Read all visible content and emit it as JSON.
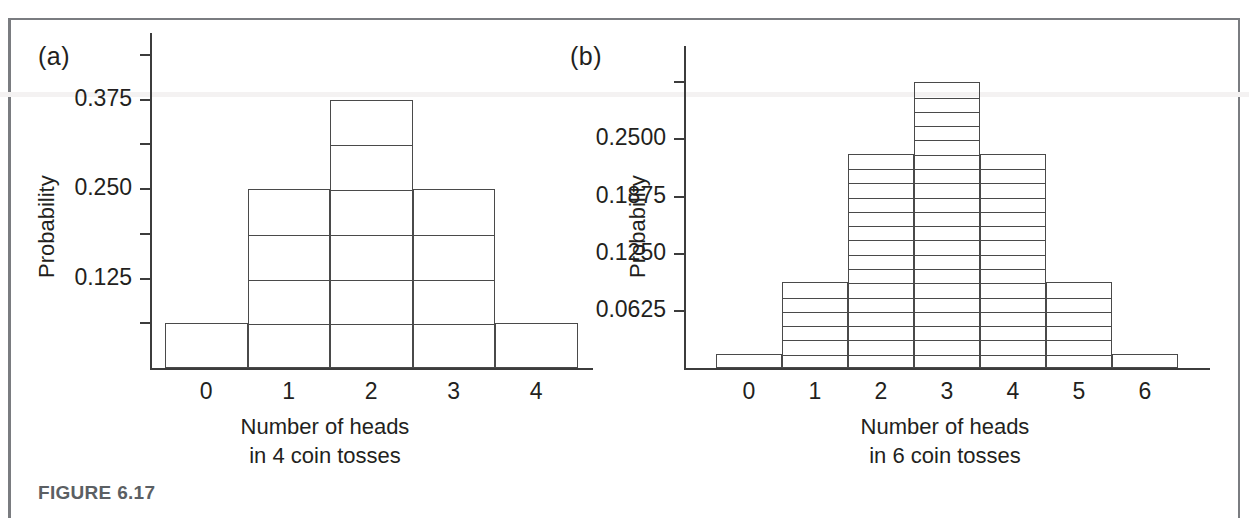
{
  "figure": {
    "caption": "FIGURE 6.17"
  },
  "panels": [
    {
      "key": "a",
      "label": "(a)",
      "ylabel": "Probability",
      "xlabel_line1": "Number of heads",
      "xlabel_line2": "in 4 coin tosses"
    },
    {
      "key": "b",
      "label": "(b)",
      "ylabel": "Probability",
      "xlabel_line1": "Number of heads",
      "xlabel_line2": "in 6 coin tosses"
    }
  ],
  "chart_data": [
    {
      "type": "bar",
      "panel": "a",
      "title": "",
      "xlabel": "Number of heads in 4 coin tosses",
      "ylabel": "Probability",
      "categories": [
        "0",
        "1",
        "2",
        "3",
        "4"
      ],
      "values": [
        0.0625,
        0.25,
        0.375,
        0.25,
        0.0625
      ],
      "counts_out_of_16": [
        1,
        4,
        6,
        4,
        1
      ],
      "ytick_labels": [
        "0.125",
        "0.250",
        "0.375"
      ],
      "ytick_values": [
        0.125,
        0.25,
        0.375
      ],
      "minor_tick_step": 0.0625,
      "ylim": [
        0,
        0.4375
      ],
      "xlim": [
        -0.5,
        4.5
      ],
      "grid": false,
      "legend": "none",
      "bar_fill": "none",
      "bar_subdivision": "0.0625"
    },
    {
      "type": "bar",
      "panel": "b",
      "title": "",
      "xlabel": "Number of heads in 6 coin tosses",
      "ylabel": "Probability",
      "categories": [
        "0",
        "1",
        "2",
        "3",
        "4",
        "5",
        "6"
      ],
      "values": [
        0.015625,
        0.09375,
        0.234375,
        0.3125,
        0.234375,
        0.09375,
        0.015625
      ],
      "counts_out_of_64": [
        1,
        6,
        15,
        20,
        15,
        6,
        1
      ],
      "ytick_labels": [
        "0.0625",
        "0.1250",
        "0.1875",
        "0.2500"
      ],
      "ytick_values": [
        0.0625,
        0.125,
        0.1875,
        0.25
      ],
      "minor_tick_step": 0.0625,
      "ylim": [
        0,
        0.328125
      ],
      "xlim": [
        -0.5,
        6.5
      ],
      "grid": false,
      "legend": "none",
      "bar_fill": "none",
      "bar_subdivision": "0.015625"
    }
  ],
  "colors": {
    "ink": "#231f20",
    "line": "#4a4a4a",
    "frame": "#7a7c80",
    "caption": "#5b5f63",
    "background": "#ffffff"
  }
}
